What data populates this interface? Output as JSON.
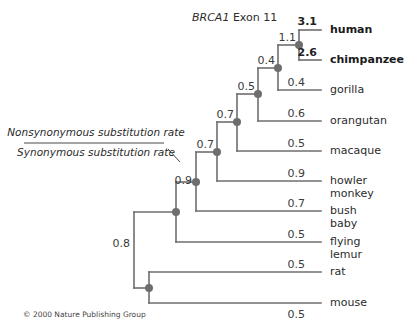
{
  "title": {
    "gene": "BRCA1",
    "suffix": " Exon 11"
  },
  "legend": {
    "numerator": "Nonsynonymous substitution rate",
    "denominator": "Synonymous substitution rate"
  },
  "taxa": [
    {
      "name": "human",
      "rate": "3.1",
      "bold": true
    },
    {
      "name": "chimpanzee",
      "rate": "2.6",
      "bold": true
    },
    {
      "name": "gorilla",
      "rate": "0.4"
    },
    {
      "name": "orangutan",
      "rate": "0.6"
    },
    {
      "name": "macaque",
      "rate": "0.5"
    },
    {
      "name": "howler",
      "name2": "monkey",
      "rate": "0.9"
    },
    {
      "name": "bush",
      "name2": "baby",
      "rate": "0.7"
    },
    {
      "name": "flying",
      "name2": "lemur",
      "rate": "0.5"
    },
    {
      "name": "rat",
      "rate": "0.5"
    },
    {
      "name": "mouse",
      "rate": "0.5"
    }
  ],
  "internal_branches": {
    "human_chimp": "1.1",
    "great_apes_gorilla": "0.4",
    "great_apes_orangutan": "0.5",
    "catarrhini": "0.7",
    "anthropoidea": "0.7",
    "primates": "0.9",
    "euarchonta": "0.8"
  },
  "copyright": "© 2000 Nature Publishing Group"
}
